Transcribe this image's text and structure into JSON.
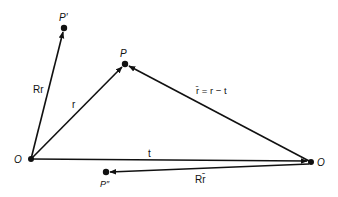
{
  "diagram": {
    "type": "vector-diagram",
    "points": {
      "origin_left": {
        "label": "O",
        "x": 31,
        "y": 159
      },
      "origin_right": {
        "label": "O",
        "x": 311,
        "y": 162
      },
      "P": {
        "label": "P",
        "x": 125,
        "y": 64
      },
      "P_prime": {
        "label": "P′",
        "x": 64,
        "y": 28
      },
      "P_double_prime": {
        "label": "P″",
        "x": 106,
        "y": 172
      }
    },
    "vectors": [
      {
        "id": "Rr",
        "label": "Rr",
        "from": "origin_left",
        "to": "P_prime"
      },
      {
        "id": "r",
        "label": "r",
        "from": "origin_left",
        "to": "P"
      },
      {
        "id": "t",
        "label": "t",
        "from": "origin_left",
        "to": "origin_right"
      },
      {
        "id": "rbar",
        "label": "r̄ = r − t",
        "from": "origin_right",
        "to": "P"
      },
      {
        "id": "Rrbar",
        "label": "Rr̄",
        "from": "origin_right",
        "to": "P_double_prime"
      }
    ],
    "labels": {
      "O_left": "O",
      "O_right": "O",
      "P": "P",
      "P_prime": "P′",
      "P_double_prime": "P″",
      "Rr": "Rr",
      "r": "r",
      "t": "t",
      "rbar_eq": "r̄ = r − t",
      "Rrbar": "Rr̄"
    },
    "colors": {
      "ink": "#111111",
      "background": "#ffffff"
    }
  }
}
